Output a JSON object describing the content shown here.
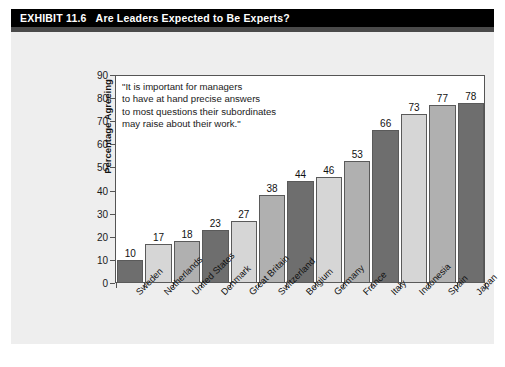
{
  "header": {
    "exhibit_number": "EXHIBIT 11.6",
    "title": "Are Leaders Expected to Be Experts?",
    "background_color": "#000000",
    "text_color": "#ffffff"
  },
  "annotation": {
    "lines": [
      "\"It is important for managers",
      "to have at hand precise answers",
      "to most questions their subordinates",
      "may raise about their work.\""
    ]
  },
  "chart_data": {
    "type": "bar",
    "title": "Are Leaders Expected to Be Experts?",
    "xlabel": "",
    "ylabel": "Percentage Agreeing",
    "ylim": [
      0,
      90
    ],
    "yticks": [
      0,
      10,
      20,
      30,
      40,
      50,
      60,
      70,
      80,
      90
    ],
    "grid": false,
    "legend": "none",
    "categories": [
      "Sweden",
      "Netherlands",
      "United States",
      "Denmark",
      "Great Britain",
      "Switzerland",
      "Belgium",
      "Germany",
      "France",
      "Italy",
      "Indonesia",
      "Spain",
      "Japan"
    ],
    "values": [
      10,
      17,
      18,
      23,
      27,
      38,
      44,
      46,
      53,
      66,
      73,
      77,
      78
    ],
    "bar_colors": [
      "#6e6e6e",
      "#d6d6d6",
      "#b0b0b0",
      "#6e6e6e",
      "#d6d6d6",
      "#b0b0b0",
      "#6e6e6e",
      "#d6d6d6",
      "#b0b0b0",
      "#6e6e6e",
      "#d6d6d6",
      "#b0b0b0",
      "#6e6e6e"
    ],
    "annotation": "\"It is important for managers to have at hand precise answers to most questions their subordinates may raise about their work.\""
  },
  "colors": {
    "panel_background": "#eeeeee",
    "plot_background": "#ffffff",
    "axis": "#555555",
    "header_shadow": "#4a4a4a"
  }
}
